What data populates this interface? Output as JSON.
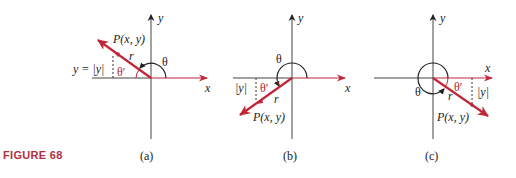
{
  "figure": {
    "caption": "FIGURE 68",
    "colors": {
      "axis": "#333333",
      "red": "#c0283a",
      "caption": "#b0303f"
    },
    "panels": [
      {
        "id": "a",
        "label": "(a)",
        "axis_x_label": "x",
        "axis_y_label": "y",
        "point_label": "P(x, y)",
        "radius_label": "r",
        "angle_label": "θ",
        "ref_angle_label": "θ′",
        "side_label": "y = |y|",
        "quadrant": "II"
      },
      {
        "id": "b",
        "label": "(b)",
        "axis_x_label": "x",
        "axis_y_label": "y",
        "point_label": "P(x, y)",
        "radius_label": "r",
        "angle_label": "θ",
        "ref_angle_label": "θ′",
        "side_label": "|y|",
        "quadrant": "III"
      },
      {
        "id": "c",
        "label": "(c)",
        "axis_x_label": "x",
        "axis_y_label": "y",
        "point_label": "P(x, y)",
        "radius_label": "r",
        "angle_label": "θ",
        "ref_angle_label": "θ′",
        "side_label": "|y|",
        "quadrant": "IV"
      }
    ]
  }
}
